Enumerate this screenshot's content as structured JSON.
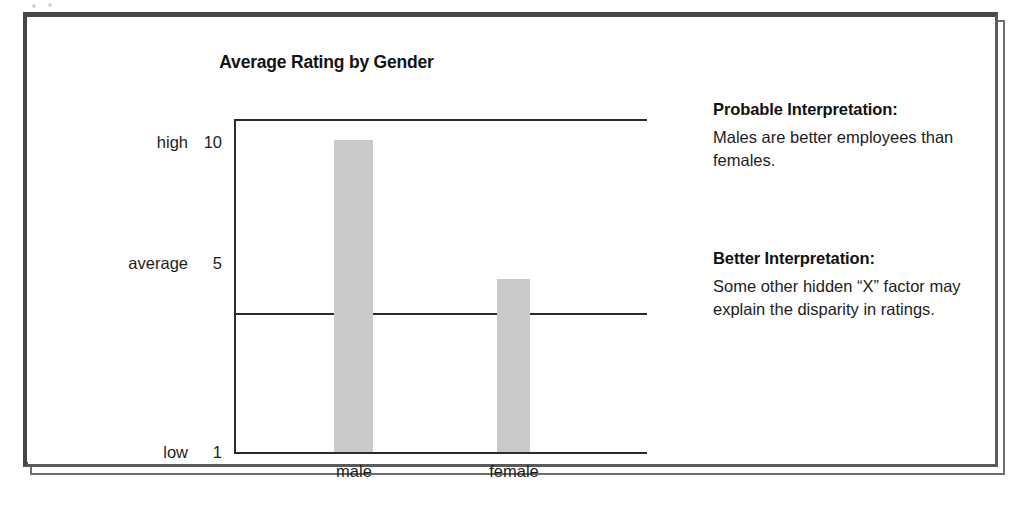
{
  "figure": {
    "frame_color": "#474747",
    "background": "#ffffff"
  },
  "chart_data": {
    "type": "bar",
    "title": "Average Rating by Gender",
    "categories": [
      "male",
      "female"
    ],
    "values": [
      10,
      6
    ],
    "series": [
      {
        "name": "Average Rating",
        "values": [
          10,
          6
        ]
      }
    ],
    "xlabel": "",
    "ylabel": "",
    "ylim": [
      1,
      10.6
    ],
    "grid": false,
    "legend": null,
    "bar_color": "#c9c9c9",
    "axis_color": "#2b2b2b",
    "y_ticks": [
      {
        "name": "high",
        "value": "10",
        "numeric": 10
      },
      {
        "name": "average",
        "value": "5",
        "numeric": 5
      },
      {
        "name": "low",
        "value": "1",
        "numeric": 1
      }
    ],
    "reference_lines": [
      {
        "at": 10,
        "label": "high"
      },
      {
        "at": 5,
        "label": "average"
      }
    ],
    "x_tick_labels": [
      "male",
      "female"
    ]
  },
  "notes": [
    {
      "heading": "Probable Interpretation:",
      "body": "Males are better employees than females."
    },
    {
      "heading": "Better Interpretation:",
      "body": "Some other hidden “X” factor may explain the disparity in ratings."
    }
  ]
}
